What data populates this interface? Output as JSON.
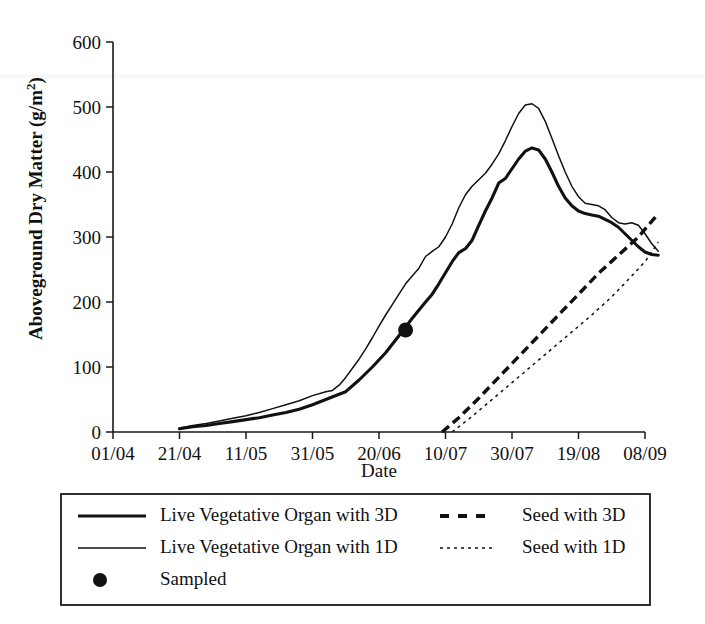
{
  "chart_data": {
    "type": "line",
    "title": "",
    "xlabel": "Date",
    "ylabel": "Aboveground Dry Matter (g/m2)",
    "ylabel_rich": "Aboveground Dry Matter (g/m",
    "ylabel_exponent": "2",
    "ylabel_close": ")",
    "xticks": [
      "01/04",
      "21/04",
      "11/05",
      "31/05",
      "20/06",
      "10/07",
      "30/07",
      "19/08",
      "08/09"
    ],
    "yticks": [
      "0",
      "100",
      "200",
      "300",
      "400",
      "500",
      "600"
    ],
    "ylim": [
      0,
      600
    ],
    "xlim_days": [
      0,
      160
    ],
    "grid": false,
    "legend_position": "below-plot",
    "series": [
      {
        "name": "Live Vegetative Organ with 3D",
        "style": "solid-thick",
        "color": "#111111",
        "points": [
          [
            20,
            5
          ],
          [
            24,
            8
          ],
          [
            28,
            10
          ],
          [
            32,
            13
          ],
          [
            36,
            16
          ],
          [
            40,
            19
          ],
          [
            44,
            22
          ],
          [
            48,
            26
          ],
          [
            52,
            30
          ],
          [
            56,
            35
          ],
          [
            60,
            42
          ],
          [
            64,
            50
          ],
          [
            68,
            58
          ],
          [
            70,
            62
          ],
          [
            74,
            80
          ],
          [
            78,
            100
          ],
          [
            82,
            122
          ],
          [
            86,
            148
          ],
          [
            90,
            175
          ],
          [
            94,
            200
          ],
          [
            96,
            212
          ],
          [
            98,
            228
          ],
          [
            100,
            245
          ],
          [
            102,
            262
          ],
          [
            104,
            276
          ],
          [
            106,
            282
          ],
          [
            108,
            295
          ],
          [
            110,
            318
          ],
          [
            112,
            340
          ],
          [
            114,
            360
          ],
          [
            116,
            383
          ],
          [
            118,
            390
          ],
          [
            120,
            405
          ],
          [
            122,
            420
          ],
          [
            124,
            432
          ],
          [
            126,
            437
          ],
          [
            128,
            434
          ],
          [
            130,
            420
          ],
          [
            132,
            400
          ],
          [
            134,
            378
          ],
          [
            136,
            360
          ],
          [
            138,
            348
          ],
          [
            140,
            340
          ],
          [
            142,
            336
          ],
          [
            144,
            334
          ],
          [
            146,
            332
          ],
          [
            148,
            327
          ],
          [
            150,
            322
          ],
          [
            152,
            315
          ],
          [
            154,
            305
          ],
          [
            156,
            295
          ],
          [
            158,
            285
          ],
          [
            160,
            277
          ],
          [
            162,
            273
          ],
          [
            164,
            272
          ]
        ]
      },
      {
        "name": "Live Vegetative Organ with 1D",
        "style": "solid-thin",
        "color": "#111111",
        "points": [
          [
            20,
            6
          ],
          [
            24,
            10
          ],
          [
            28,
            13
          ],
          [
            32,
            17
          ],
          [
            36,
            21
          ],
          [
            40,
            25
          ],
          [
            44,
            30
          ],
          [
            48,
            36
          ],
          [
            52,
            42
          ],
          [
            56,
            48
          ],
          [
            60,
            56
          ],
          [
            64,
            62
          ],
          [
            66,
            64
          ],
          [
            68,
            72
          ],
          [
            70,
            84
          ],
          [
            72,
            98
          ],
          [
            74,
            112
          ],
          [
            76,
            128
          ],
          [
            78,
            145
          ],
          [
            80,
            163
          ],
          [
            82,
            180
          ],
          [
            84,
            196
          ],
          [
            86,
            212
          ],
          [
            88,
            228
          ],
          [
            90,
            240
          ],
          [
            92,
            252
          ],
          [
            94,
            270
          ],
          [
            96,
            278
          ],
          [
            98,
            285
          ],
          [
            100,
            300
          ],
          [
            102,
            320
          ],
          [
            104,
            345
          ],
          [
            106,
            365
          ],
          [
            108,
            378
          ],
          [
            110,
            388
          ],
          [
            112,
            398
          ],
          [
            114,
            412
          ],
          [
            116,
            428
          ],
          [
            118,
            448
          ],
          [
            120,
            470
          ],
          [
            122,
            490
          ],
          [
            124,
            503
          ],
          [
            126,
            505
          ],
          [
            128,
            498
          ],
          [
            130,
            478
          ],
          [
            132,
            452
          ],
          [
            134,
            425
          ],
          [
            136,
            400
          ],
          [
            138,
            378
          ],
          [
            140,
            362
          ],
          [
            142,
            352
          ],
          [
            144,
            350
          ],
          [
            146,
            348
          ],
          [
            148,
            342
          ],
          [
            150,
            330
          ],
          [
            152,
            322
          ],
          [
            154,
            320
          ],
          [
            156,
            322
          ],
          [
            158,
            318
          ],
          [
            160,
            305
          ],
          [
            162,
            290
          ],
          [
            164,
            278
          ]
        ]
      },
      {
        "name": "Seed with 3D",
        "style": "dashed-thick",
        "color": "#111111",
        "points": [
          [
            99,
            0
          ],
          [
            104,
            22
          ],
          [
            110,
            52
          ],
          [
            116,
            84
          ],
          [
            122,
            116
          ],
          [
            128,
            148
          ],
          [
            134,
            180
          ],
          [
            140,
            212
          ],
          [
            146,
            244
          ],
          [
            152,
            272
          ],
          [
            158,
            300
          ],
          [
            164,
            336
          ]
        ]
      },
      {
        "name": "Seed with 1D",
        "style": "dotted-thin",
        "color": "#111111",
        "points": [
          [
            102,
            0
          ],
          [
            108,
            24
          ],
          [
            114,
            50
          ],
          [
            120,
            76
          ],
          [
            126,
            102
          ],
          [
            132,
            128
          ],
          [
            138,
            154
          ],
          [
            144,
            180
          ],
          [
            150,
            208
          ],
          [
            156,
            240
          ],
          [
            160,
            262
          ],
          [
            164,
            292
          ]
        ]
      }
    ],
    "markers": [
      {
        "name": "Sampled",
        "style": "filled-circle",
        "color": "#111111",
        "points": [
          [
            88,
            157
          ]
        ]
      }
    ]
  },
  "legend": {
    "entries": [
      {
        "label": "Live Vegetative Organ with 3D",
        "style": "solid-thick",
        "column": 0,
        "row": 0
      },
      {
        "label": "Live Vegetative Organ with 1D",
        "style": "solid-thin",
        "column": 0,
        "row": 1
      },
      {
        "label": "Sampled",
        "style": "filled-circle",
        "column": 0,
        "row": 2
      },
      {
        "label": "Seed with 3D",
        "style": "dashed-thick",
        "column": 1,
        "row": 0
      },
      {
        "label": "Seed with 1D",
        "style": "dotted-thin",
        "column": 1,
        "row": 1
      }
    ]
  },
  "colors": {
    "ink": "#111111",
    "paper": "#ffffff"
  }
}
